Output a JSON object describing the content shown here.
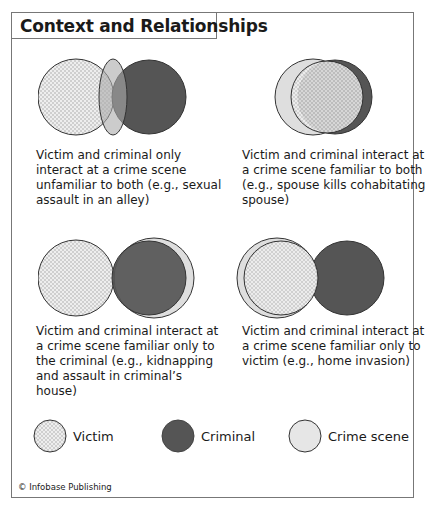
{
  "title": "Context and Relationships",
  "colors": {
    "victim_fill": "#eeeeee",
    "victim_dots": "#9a9a9a",
    "criminal": "#555555",
    "crime_scene": "#dedede",
    "stroke": "#333333"
  },
  "panels": [
    {
      "caption": "Victim and criminal only interact at a crime scene unfamiliar to both (e.g., sexual assault in an alley)"
    },
    {
      "caption": "Victim and criminal interact at a crime scene familiar to both (e.g., spouse kills cohabitating spouse)"
    },
    {
      "caption": "Victim and criminal interact at a crime scene familiar only to the criminal (e.g., kidnapping and assault in criminal’s house)"
    },
    {
      "caption": "Victim and criminal interact at a crime scene familiar only to victim (e.g., home invasion)"
    }
  ],
  "legend": {
    "victim": "Victim",
    "criminal": "Criminal",
    "crime_scene": "Crime scene"
  },
  "credit": "© Infobase Publishing"
}
